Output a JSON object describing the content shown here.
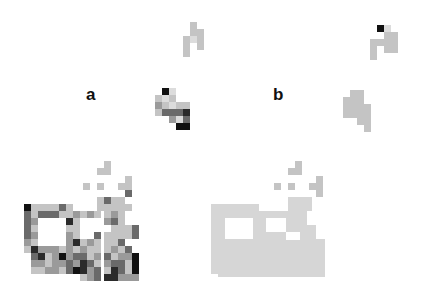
{
  "figure": {
    "panels": [
      {
        "id": "a",
        "label": "a",
        "label_pos": [
          86,
          86
        ]
      },
      {
        "id": "b",
        "label": "b",
        "label_pos": [
          273,
          86
        ]
      }
    ],
    "cell_size": 7,
    "shade_legend": {
      "c0": "#dcdcdc",
      "c1": "#c4c4c4",
      "c2": "#9a9a9a",
      "c3": "#6a6a6a",
      "c4": "#2a2a2a",
      "c5": "#111111",
      "cb": "#d6d6d6"
    }
  }
}
